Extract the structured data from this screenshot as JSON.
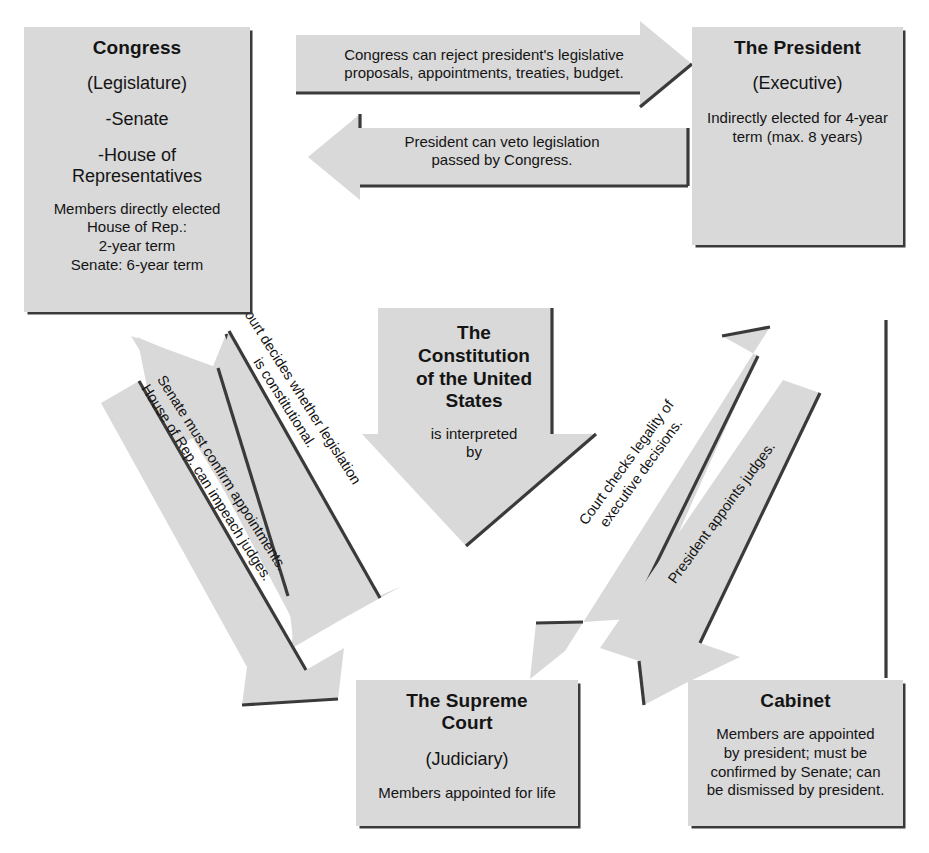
{
  "diagram": {
    "fill_color": "#d9d9d9",
    "edge_color": "#3a3a3a",
    "background_color": "#ffffff"
  },
  "boxes": {
    "congress": {
      "title": "Congress",
      "subtitle": "(Legislature)",
      "items": [
        "-Senate",
        "-House of",
        "Representatives"
      ],
      "body": [
        "Members directly elected",
        "House of Rep.:",
        "2-year term",
        "Senate: 6-year term"
      ]
    },
    "president": {
      "title": "The President",
      "subtitle": "(Executive)",
      "body": [
        "Indirectly elected for 4-year",
        "term (max. 8 years)"
      ]
    },
    "supreme_court": {
      "title_line1": "The Supreme",
      "title_line2": "Court",
      "subtitle": "(Judiciary)",
      "body": [
        "Members appointed for life"
      ]
    },
    "cabinet": {
      "title": "Cabinet",
      "body": [
        "Members are appointed",
        "by president; must be",
        "confirmed by Senate; can",
        "be dismissed by president."
      ]
    }
  },
  "constitution": {
    "title_lines": [
      "The",
      "Constitution",
      "of the United",
      "States"
    ],
    "sub_lines": [
      "is interpreted",
      "by"
    ]
  },
  "arrows": {
    "congress_rejects": {
      "lines": [
        "Congress can reject president's legislative",
        "proposals, appointments, treaties, budget."
      ],
      "direction": "right"
    },
    "president_vetoes": {
      "lines": [
        "President can veto legislation",
        "passed by Congress."
      ],
      "direction": "left"
    },
    "court_decides": {
      "lines": [
        "Court decides whether legislation",
        "is constitutional."
      ],
      "direction": "up-left"
    },
    "senate_confirms": {
      "lines": [
        "Senate must confirm appointments.",
        "House of Rep. can impeach judges."
      ],
      "direction": "down-right"
    },
    "court_checks": {
      "lines": [
        "Court checks legality of",
        "executive decisions."
      ],
      "direction": "up-right"
    },
    "president_appoints": {
      "lines": [
        "President appoints judges."
      ],
      "direction": "down-left"
    }
  }
}
